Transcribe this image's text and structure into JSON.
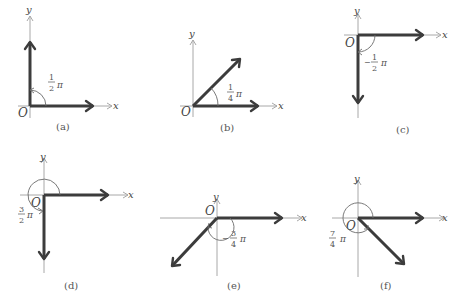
{
  "figure": {
    "panels": [
      {
        "id": "a",
        "caption": "(a)",
        "angle_num": "1",
        "angle_den": "2",
        "angle_sign": "",
        "pi": "π",
        "x_label": "x",
        "y_label": "y",
        "origin_label": "O"
      },
      {
        "id": "b",
        "caption": "(b)",
        "angle_num": "1",
        "angle_den": "4",
        "angle_sign": "",
        "pi": "π",
        "x_label": "x",
        "y_label": "y",
        "origin_label": "O"
      },
      {
        "id": "c",
        "caption": "(c)",
        "angle_num": "1",
        "angle_den": "2",
        "angle_sign": "−",
        "pi": "π",
        "x_label": "x",
        "y_label": "y",
        "origin_label": "O"
      },
      {
        "id": "d",
        "caption": "(d)",
        "angle_num": "3",
        "angle_den": "2",
        "angle_sign": "",
        "pi": "π",
        "x_label": "x",
        "y_label": "y",
        "origin_label": "O"
      },
      {
        "id": "e",
        "caption": "(e)",
        "angle_num": "3",
        "angle_den": "4",
        "angle_sign": "−",
        "pi": "π",
        "x_label": "x",
        "y_label": "y",
        "origin_label": "O"
      },
      {
        "id": "f",
        "caption": "(f)",
        "angle_num": "7",
        "angle_den": "4",
        "angle_sign": "",
        "pi": "π",
        "x_label": "x",
        "y_label": "y",
        "origin_label": "O"
      }
    ]
  },
  "colors": {
    "axis": "#a8a8a8",
    "vector": "#3c3c3c",
    "text": "#444444"
  }
}
